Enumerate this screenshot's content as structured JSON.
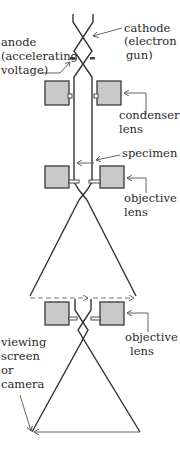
{
  "diagram": {
    "colors": {
      "background": "#ffffff",
      "beam": "#333333",
      "lens_fill": "#c9c9c9",
      "lens_stroke": "#3a3a3a",
      "leader": "#555555"
    },
    "labels": {
      "cathode": [
        "cathode",
        "(electron",
        "gun)"
      ],
      "anode": [
        "anode",
        "(accelerating",
        "voltage)"
      ],
      "condenser_lens": [
        "condenser",
        "lens"
      ],
      "specimen": [
        "specimen"
      ],
      "objective_lens_1": [
        "objective",
        "lens"
      ],
      "objective_lens_2": [
        "objective",
        "lens"
      ],
      "viewing_screen": [
        "viewing",
        "screen",
        "or",
        "camera"
      ]
    },
    "components": [
      {
        "id": "cathode",
        "type": "electron-source"
      },
      {
        "id": "anode",
        "type": "accelerator"
      },
      {
        "id": "condenser-lens",
        "type": "lens"
      },
      {
        "id": "specimen",
        "type": "sample"
      },
      {
        "id": "objective-lens-1",
        "type": "lens"
      },
      {
        "id": "intermediate-image",
        "type": "image-plane"
      },
      {
        "id": "objective-lens-2",
        "type": "lens"
      },
      {
        "id": "viewing-screen",
        "type": "detector"
      }
    ]
  }
}
